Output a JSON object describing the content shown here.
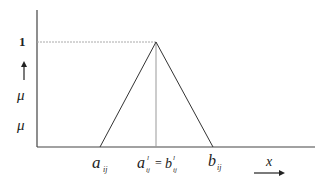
{
  "diagram": {
    "y_axis": {
      "tick_label": "1",
      "symbol_upper": "μ",
      "symbol_lower": "μ"
    },
    "x_axis": {
      "symbol": "x"
    },
    "points": {
      "left_base": {
        "base": "a",
        "sub": "ij"
      },
      "peak": {
        "left_base": "a",
        "left_sub": "ij",
        "left_sup": "l",
        "eq": "=",
        "right_base": "b",
        "right_sub": "ij",
        "right_sup": "l"
      },
      "right_base": {
        "base": "b",
        "sub": "ij"
      }
    },
    "colors": {
      "line": "#333333",
      "guide": "#aaaaaa"
    }
  }
}
